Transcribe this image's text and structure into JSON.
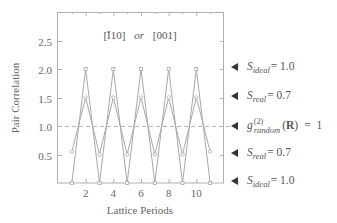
{
  "chart_data": {
    "type": "line",
    "title": "[Ī10] or [001]",
    "title_parts": {
      "dir1": "[Ī10]",
      "connector": "or",
      "dir2": "[001]"
    },
    "xlabel": "Lattice Periods",
    "ylabel": "Pair Correlation",
    "xlim": [
      0,
      12
    ],
    "ylim": [
      0,
      3.0
    ],
    "xticks": [
      2,
      4,
      6,
      8,
      10
    ],
    "xtick_labels": [
      "2",
      "4",
      "6",
      "8",
      "10"
    ],
    "yticks": [
      0.5,
      1.0,
      1.5,
      2.0,
      2.5
    ],
    "ytick_labels": [
      "0.5",
      "1.0",
      "1.5",
      "2.0",
      "2.5"
    ],
    "grid": false,
    "reference_line": {
      "y": 1.0,
      "style": "dashed"
    },
    "series": [
      {
        "name": "ideal",
        "x": [
          1,
          2,
          3,
          4,
          5,
          6,
          7,
          8,
          9,
          10,
          11
        ],
        "values": [
          0,
          2.0,
          0,
          2.0,
          0,
          2.0,
          0,
          2.0,
          0,
          2.0,
          0
        ],
        "marker": "square"
      },
      {
        "name": "real",
        "x": [
          1,
          2,
          3,
          4,
          5,
          6,
          7,
          8,
          9,
          10,
          11
        ],
        "values": [
          0.55,
          1.5,
          0.5,
          1.5,
          0.5,
          1.5,
          0.5,
          1.5,
          0.5,
          1.5,
          0.55
        ],
        "marker": "circle"
      }
    ],
    "annotations": [
      {
        "y": 2.0,
        "symbol": "S",
        "subscript": "ideal",
        "text": "= 1.0"
      },
      {
        "y": 1.5,
        "symbol": "S",
        "subscript": "real",
        "text": "= 0.7"
      },
      {
        "y": 1.0,
        "symbol": "g",
        "superscript": "(2)",
        "subscript": "random",
        "arg": "(R)",
        "text": "= 1"
      },
      {
        "y": 0.5,
        "symbol": "S",
        "subscript": "real",
        "text": "= 0.7"
      },
      {
        "y": 0.0,
        "symbol": "S",
        "subscript": "ideal",
        "text": "= 1.0"
      }
    ]
  },
  "colors": {
    "frame": "#b0b0b0",
    "ideal_line": "#a8a8a8",
    "real_line": "#a8a8a8",
    "reference_line": "#b8b8b8",
    "text": "#555555",
    "arrow": "#333333"
  }
}
